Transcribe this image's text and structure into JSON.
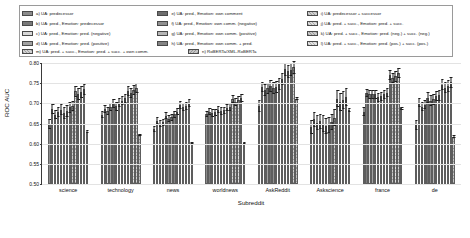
{
  "chart_data": {
    "type": "bar",
    "title": "",
    "xlabel": "Subreddit",
    "ylabel": "ROC AUC",
    "ylim": [
      0.5,
      0.8
    ],
    "yticks": [
      "0.50",
      "0.55",
      "0.60",
      "0.65",
      "0.70",
      "0.75",
      "0.80"
    ],
    "ytick_values": [
      0.5,
      0.55,
      0.6,
      0.65,
      0.7,
      0.75,
      0.8
    ],
    "grid": true,
    "legend_position": "above-plot",
    "error_bars": true,
    "categories": [
      "science",
      "technology",
      "news",
      "worldnews",
      "AskReddit",
      "Askscience",
      "france",
      "de"
    ],
    "series": [
      {
        "name": "a) UA: predecessor",
        "values": [
          0.648,
          0.672,
          0.637,
          0.673,
          0.693,
          0.641,
          0.679,
          0.646
        ],
        "err": [
          0.012,
          0.009,
          0.008,
          0.008,
          0.015,
          0.018,
          0.011,
          0.012
        ]
      },
      {
        "name": "b) UA: pred.,  Emotion: predecessor",
        "values": [
          0.686,
          0.686,
          0.657,
          0.679,
          0.74,
          0.66,
          0.726,
          0.702
        ],
        "err": [
          0.013,
          0.01,
          0.009,
          0.009,
          0.013,
          0.019,
          0.01,
          0.012
        ]
      },
      {
        "name": "c) UA: pred.,  Emotion: pred. (negative)",
        "values": [
          0.672,
          0.682,
          0.65,
          0.676,
          0.733,
          0.652,
          0.722,
          0.692
        ],
        "err": [
          0.012,
          0.01,
          0.009,
          0.009,
          0.014,
          0.019,
          0.011,
          0.012
        ]
      },
      {
        "name": "d) UA: pred.,  Emotion: pred. (positive)",
        "values": [
          0.679,
          0.69,
          0.653,
          0.678,
          0.737,
          0.655,
          0.723,
          0.697
        ],
        "err": [
          0.013,
          0.01,
          0.009,
          0.009,
          0.014,
          0.019,
          0.011,
          0.012
        ]
      },
      {
        "name": "e) UA: pred.,  Emotion: own comment",
        "values": [
          0.684,
          0.699,
          0.669,
          0.684,
          0.742,
          0.65,
          0.722,
          0.714
        ],
        "err": [
          0.014,
          0.011,
          0.009,
          0.009,
          0.015,
          0.02,
          0.011,
          0.013
        ]
      },
      {
        "name": "f) UA: pred.,  Emotion: own comm. (negative)",
        "values": [
          0.676,
          0.693,
          0.662,
          0.681,
          0.737,
          0.644,
          0.715,
          0.707
        ],
        "err": [
          0.014,
          0.011,
          0.009,
          0.009,
          0.015,
          0.02,
          0.011,
          0.013
        ]
      },
      {
        "name": "g) UA: pred.,  Emotion: own comm. (positive)",
        "values": [
          0.681,
          0.702,
          0.665,
          0.683,
          0.74,
          0.647,
          0.718,
          0.71
        ],
        "err": [
          0.014,
          0.011,
          0.009,
          0.009,
          0.015,
          0.02,
          0.011,
          0.013
        ]
      },
      {
        "name": "h) UA: pred.,  Emotion: own comm. + pred.",
        "values": [
          0.69,
          0.707,
          0.673,
          0.689,
          0.747,
          0.653,
          0.723,
          0.718
        ],
        "err": [
          0.014,
          0.011,
          0.009,
          0.009,
          0.015,
          0.02,
          0.011,
          0.013
        ]
      },
      {
        "name": "i) UA: predecessor + successor",
        "values": [
          0.693,
          0.713,
          0.679,
          0.691,
          0.761,
          0.664,
          0.726,
          0.72
        ],
        "err": [
          0.013,
          0.011,
          0.009,
          0.009,
          0.015,
          0.021,
          0.011,
          0.013
        ]
      },
      {
        "name": "j) UA: pred. + succ.,  Emotion: pred. + succ.",
        "values": [
          0.73,
          0.73,
          0.697,
          0.71,
          0.785,
          0.712,
          0.77,
          0.746
        ],
        "err": [
          0.014,
          0.013,
          0.01,
          0.01,
          0.016,
          0.022,
          0.013,
          0.014
        ]
      },
      {
        "name": "k) UA: pred. + succ.,  Emotion: pred. (neg.) + succ. (neg.)",
        "values": [
          0.723,
          0.726,
          0.69,
          0.704,
          0.779,
          0.703,
          0.763,
          0.739
        ],
        "err": [
          0.014,
          0.013,
          0.01,
          0.01,
          0.016,
          0.022,
          0.013,
          0.014
        ]
      },
      {
        "name": "l) UA: pred. + succ.,  Emotion: pred. (pos.) + succ. (pos.)",
        "values": [
          0.728,
          0.733,
          0.694,
          0.708,
          0.783,
          0.708,
          0.767,
          0.743
        ],
        "err": [
          0.014,
          0.013,
          0.01,
          0.01,
          0.016,
          0.022,
          0.013,
          0.014
        ]
      },
      {
        "name": "m) UA: pred. + succ.,  Emotion: pred. + succ. + own comm.",
        "values": [
          0.735,
          0.738,
          0.702,
          0.713,
          0.79,
          0.716,
          0.775,
          0.752
        ],
        "err": [
          0.014,
          0.013,
          0.01,
          0.01,
          0.016,
          0.022,
          0.013,
          0.014
        ]
      },
      {
        "name": "n) RoBERTa/XML-RoBERTa",
        "values": [
          0.63,
          0.622,
          0.602,
          0.601,
          0.712,
          0.684,
          0.688,
          0.617
        ],
        "err": [
          0.003,
          0.003,
          0.003,
          0.003,
          0.004,
          0.005,
          0.004,
          0.004
        ]
      }
    ]
  },
  "legend": {
    "col1": [
      "a) UA: predecessor",
      "b) UA: pred.,  Emotion: predecessor",
      "c) UA: pred.,  Emotion: pred. (negative)",
      "d) UA: pred.,  Emotion: pred. (positive)"
    ],
    "col2": [
      "e) UA: pred.,  Emotion: own comment",
      "f) UA: pred.,  Emotion: own comm. (negative)",
      "g) UA: pred.,  Emotion: own comm. (positive)",
      "h) UA: pred.,  Emotion: own comm. + pred."
    ],
    "col3": [
      "i) UA: predecessor + successor",
      "j) UA: pred. + succ.,  Emotion: pred. + succ.",
      "k) UA: pred. + succ.,  Emotion: pred. (neg.) + succ. (neg.)",
      "l) UA: pred. + succ.,  Emotion: pred. (pos.) + succ. (pos.)"
    ],
    "wide1": "m) UA: pred. + succ.,  Emotion: pred. + succ. + own comm.",
    "wide2": "n) RoBERTa/XML-RoBERTa"
  }
}
